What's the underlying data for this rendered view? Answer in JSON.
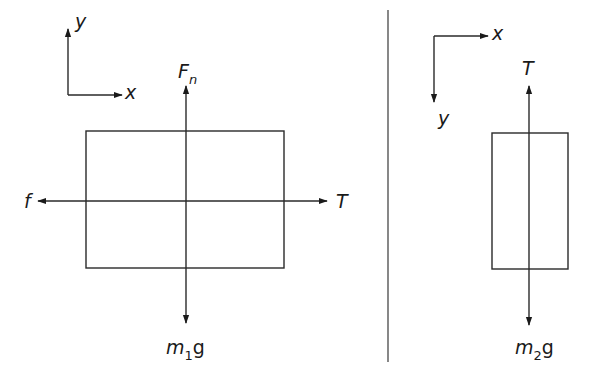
{
  "diagram": {
    "type": "free-body-diagram",
    "left_panel": {
      "axes": {
        "x_label": "x",
        "y_label": "y",
        "orientation": "x-right, y-up"
      },
      "body": "block on horizontal surface",
      "forces": {
        "normal": {
          "label": "F",
          "subscript": "n",
          "direction": "up"
        },
        "friction": {
          "label": "f",
          "direction": "left"
        },
        "tension": {
          "label": "T",
          "direction": "right"
        },
        "weight": {
          "label": "m",
          "subscript": "1",
          "suffix": "g",
          "direction": "down"
        }
      }
    },
    "right_panel": {
      "axes": {
        "x_label": "x",
        "y_label": "y",
        "orientation": "x-right, y-down"
      },
      "body": "hanging block",
      "forces": {
        "tension": {
          "label": "T",
          "direction": "up"
        },
        "weight": {
          "label": "m",
          "subscript": "2",
          "suffix": "g",
          "direction": "down"
        }
      }
    },
    "colors": {
      "line": "#2a2a2a",
      "background": "#ffffff",
      "divider": "#555555"
    }
  }
}
